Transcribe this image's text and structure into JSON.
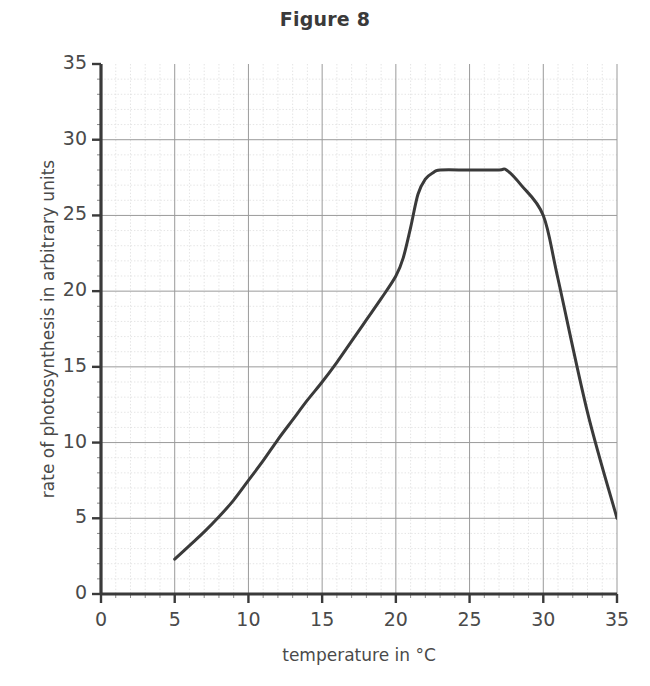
{
  "title": "Figure 8",
  "chart_data": {
    "type": "line",
    "title": "Figure 8",
    "xlabel": "temperature in °C",
    "ylabel": "rate of photosynthesis in arbitrary units",
    "xlim": [
      0,
      35
    ],
    "ylim": [
      0,
      35
    ],
    "xticks": [
      0,
      5,
      10,
      15,
      20,
      25,
      30,
      35
    ],
    "yticks": [
      0,
      5,
      10,
      15,
      20,
      25,
      30,
      35
    ],
    "xtick_labels": [
      "0",
      "5",
      "10",
      "15",
      "20",
      "25",
      "30",
      "35"
    ],
    "ytick_labels": [
      "0",
      "5",
      "10",
      "15",
      "20",
      "25",
      "30",
      "35"
    ],
    "grid": true,
    "grid_major_step": 5,
    "grid_minor_step": 1,
    "legend": null,
    "series": [
      {
        "name": "rate of photosynthesis",
        "color": "#3a3a3a",
        "line_width": 3,
        "x": [
          5,
          6,
          7,
          8,
          9,
          10,
          11,
          12,
          13,
          14,
          15,
          16,
          17,
          18,
          19,
          20,
          20.5,
          21,
          21.5,
          22,
          22.5,
          23,
          25,
          27,
          27.5,
          28.5,
          30,
          31,
          33,
          35
        ],
        "y": [
          2.3,
          3.2,
          4.1,
          5.1,
          6.2,
          7.5,
          8.8,
          10.2,
          11.5,
          12.8,
          14.0,
          15.3,
          16.7,
          18.1,
          19.5,
          21.0,
          22.2,
          24.2,
          26.4,
          27.4,
          27.8,
          28.0,
          28.0,
          28.0,
          28.0,
          27.0,
          25.0,
          20.8,
          12.0,
          5.0
        ]
      }
    ],
    "annotations": [
      {
        "text": "curve begins at 5 °C",
        "x": 5,
        "y": 2.3
      },
      {
        "text": "plateau at 28 units",
        "x": 25,
        "y": 28
      },
      {
        "text": "kink at 30 °C",
        "x": 30,
        "y": 25
      },
      {
        "text": "curve ends at 35 °C",
        "x": 35,
        "y": 5
      }
    ]
  }
}
